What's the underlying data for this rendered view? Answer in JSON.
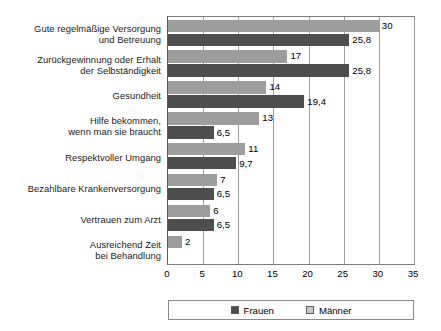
{
  "chart_data": {
    "type": "bar",
    "orientation": "horizontal",
    "title": "",
    "xlabel": "",
    "ylabel": "",
    "xlim": [
      0,
      35
    ],
    "xticks": [
      0,
      5,
      10,
      15,
      20,
      25,
      30,
      35
    ],
    "xtick_labels": [
      "0",
      "5",
      "10",
      "15",
      "20",
      "25",
      "30",
      "35"
    ],
    "grid": "vertical",
    "legend_position": "bottom",
    "decimal_separator": ",",
    "categories": [
      "Gute regelmäßige Versorgung\nund Betreuung",
      "Zurückgewinnung oder Erhalt\nder Selbständigkeit",
      "Gesundheit",
      "Hilfe bekommen,\nwenn man sie braucht",
      "Respektvoller Umgang",
      "Bezahlbare Krankenversorgung",
      "Vertrauen zum Arzt",
      "Ausreichend Zeit\nbei Behandlung"
    ],
    "series": [
      {
        "name": "Männer",
        "color": "#9d9d9d",
        "values": [
          30,
          17,
          14,
          13,
          11,
          7,
          6,
          2
        ],
        "value_labels": [
          "30",
          "17",
          "14",
          "13",
          "11",
          "7",
          "6",
          "2"
        ]
      },
      {
        "name": "Frauen",
        "color": "#4d4d4d",
        "values": [
          25.8,
          25.8,
          19.4,
          6.5,
          9.7,
          6.5,
          6.5,
          null
        ],
        "value_labels": [
          "25,8",
          "25,8",
          "19,4",
          "6,5",
          "9,7",
          "6,5",
          "6,5",
          ""
        ]
      }
    ]
  },
  "legend": {
    "items": [
      {
        "label": "Frauen",
        "color": "#4d4d4d"
      },
      {
        "label": "Männer",
        "color": "#c9c9c9"
      }
    ]
  }
}
